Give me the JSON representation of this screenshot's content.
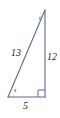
{
  "figure": {
    "kind": "right-triangle-diagram",
    "background_color": "#ffffff",
    "stroke_color": "#5a6a96",
    "label_color": "#1b1b28",
    "labels": {
      "hypotenuse": "13",
      "vertical_leg": "12",
      "base": "5",
      "angle_top": "t",
      "angle_bottom_left": "s"
    },
    "markers": {
      "right_angle": "right-angle-square"
    },
    "geometry": {
      "apex": [
        45,
        10
      ],
      "bottom_left": [
        8,
        97
      ],
      "bottom_right": [
        45,
        97
      ]
    }
  }
}
